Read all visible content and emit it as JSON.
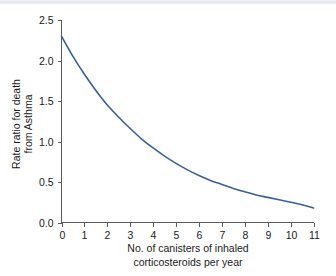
{
  "figure": {
    "background_color": "#ffffff",
    "top_band_color": "#dfe4ec",
    "width": 336,
    "height": 276
  },
  "chart_data": {
    "type": "line",
    "title": "",
    "subtitle": "",
    "xlabel_line1": "No. of canisters of inhaled",
    "xlabel_line2": "corticosteroids per year",
    "ylabel_line1": "Rate ratio for death",
    "ylabel_line2": "from Asthma",
    "xlim": [
      0,
      11
    ],
    "ylim": [
      0,
      2.5
    ],
    "grid": false,
    "legend": null,
    "legend_position": "none",
    "line_color": "#3a5f9a",
    "axis_color": "#5b5b5b",
    "xticks": [
      0,
      1,
      2,
      3,
      4,
      5,
      6,
      7,
      8,
      9,
      10,
      11
    ],
    "xticklabels": [
      "0",
      "1",
      "2",
      "3",
      "4",
      "5",
      "6",
      "7",
      "8",
      "9",
      "10",
      "11"
    ],
    "yticks": [
      0.0,
      0.5,
      1.0,
      1.5,
      2.0,
      2.5
    ],
    "yticklabels": [
      "0.0",
      "0.5",
      "1.0",
      "1.5",
      "2.0",
      "2.5"
    ],
    "series": [
      {
        "name": "Rate ratio for death from asthma",
        "x": [
          0,
          0.5,
          1,
          1.5,
          2,
          2.5,
          3,
          3.5,
          4,
          4.5,
          5,
          5.5,
          6,
          6.5,
          7,
          7.5,
          8,
          8.5,
          9,
          9.5,
          10,
          10.5,
          11
        ],
        "values": [
          2.3,
          2.05,
          1.83,
          1.63,
          1.45,
          1.3,
          1.16,
          1.03,
          0.92,
          0.82,
          0.73,
          0.65,
          0.58,
          0.52,
          0.47,
          0.42,
          0.38,
          0.34,
          0.31,
          0.28,
          0.25,
          0.22,
          0.18
        ]
      }
    ],
    "annotations": []
  }
}
